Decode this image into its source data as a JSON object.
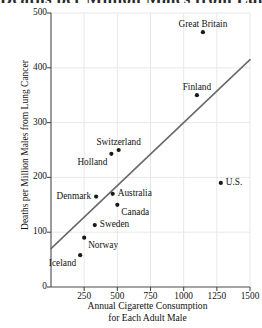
{
  "figure": {
    "clipped_title": "Deaths per Million Males from Lung Cancer",
    "background": "#ffffff",
    "axis_color": "#4a4a4a",
    "grid_color": "#e8e8e8",
    "point_color": "#1a1a1a",
    "line_color": "#6a6a6a"
  },
  "chart_data": {
    "type": "scatter",
    "title": "",
    "xlabel": "Annual Cigarette Consumption for Each Adult Male",
    "xlabel_line1": "Annual Cigarette Consumption",
    "xlabel_line2": "for Each Adult Male",
    "ylabel": "Deaths per Million Males from Lung Cancer",
    "xlim": [
      0,
      1500
    ],
    "ylim": [
      0,
      500
    ],
    "xticks": [
      0,
      250,
      500,
      750,
      1000,
      1250,
      1500
    ],
    "xtick_labels": [
      "",
      "250",
      "500",
      "750",
      "1000",
      "1250",
      "1500"
    ],
    "yticks": [
      0,
      100,
      200,
      300,
      400,
      500
    ],
    "ytick_labels": [
      "0",
      "100",
      "200",
      "300",
      "400",
      "500"
    ],
    "grid": true,
    "legend": "none",
    "points": [
      {
        "label": "Great Britain",
        "x": 1145,
        "y": 465,
        "label_pos": "above"
      },
      {
        "label": "Finland",
        "x": 1100,
        "y": 350,
        "label_pos": "above"
      },
      {
        "label": "U.S.",
        "x": 1280,
        "y": 190,
        "label_pos": "right"
      },
      {
        "label": "Switzerland",
        "x": 510,
        "y": 250,
        "label_pos": "above"
      },
      {
        "label": "Holland",
        "x": 455,
        "y": 243,
        "label_pos": "below-left"
      },
      {
        "label": "Australia",
        "x": 465,
        "y": 170,
        "label_pos": "right"
      },
      {
        "label": "Denmark",
        "x": 340,
        "y": 165,
        "label_pos": "left"
      },
      {
        "label": "Canada",
        "x": 500,
        "y": 150,
        "label_pos": "below-right"
      },
      {
        "label": "Sweden",
        "x": 330,
        "y": 113,
        "label_pos": "right"
      },
      {
        "label": "Norway",
        "x": 250,
        "y": 90,
        "label_pos": "below-right"
      },
      {
        "label": "Iceland",
        "x": 220,
        "y": 58,
        "label_pos": "below-left"
      }
    ],
    "trend_line": {
      "description": "regression line",
      "x_start": 0,
      "y_start": 70,
      "x_end": 1500,
      "y_end": 415
    }
  }
}
